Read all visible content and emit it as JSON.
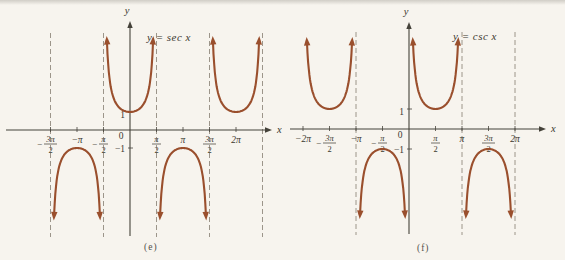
{
  "styles": {
    "background": "#f7f4ee",
    "curve_color": "#9a4f2d",
    "axis_color": "#45423a",
    "asymptote_color": "#918a7e",
    "label_color": "#3b382f",
    "caption_color": "#53504a"
  },
  "chart_data": [
    {
      "type": "line",
      "panel": "e",
      "title": "y = sec x",
      "function": "sec",
      "caption": "(e)",
      "xlabel": "x",
      "ylabel": "y",
      "ylim": [
        -4.8,
        5.0
      ],
      "grid": false,
      "branches": [
        {
          "center_halfpi": 0,
          "direction": "up",
          "extremum_x": "0",
          "extremum_y": 1
        },
        {
          "center_halfpi": -2,
          "direction": "down",
          "extremum_x": "−π",
          "extremum_y": -1
        },
        {
          "center_halfpi": 2,
          "direction": "down",
          "extremum_x": "π",
          "extremum_y": -1
        },
        {
          "center_halfpi": 4,
          "direction": "up",
          "extremum_x": "2π",
          "extremum_y": 1
        }
      ],
      "asymptotes_halfpi": [
        -3,
        -1,
        1,
        3,
        5
      ],
      "x_ticks": [
        {
          "value_halfpi": -3,
          "value": "−3π/2",
          "display": {
            "type": "frac",
            "sign": "−",
            "num": "3π",
            "den": "2"
          }
        },
        {
          "value_halfpi": -2,
          "value": "−π",
          "display": {
            "type": "plain",
            "text": "−π"
          }
        },
        {
          "value_halfpi": -1,
          "value": "−π/2",
          "display": {
            "type": "frac",
            "sign": "−",
            "num": "π",
            "den": "2"
          }
        },
        {
          "value_halfpi": 0,
          "value": "0",
          "display": {
            "type": "plain",
            "text": "0"
          },
          "at_origin": true
        },
        {
          "value_halfpi": 1,
          "value": "π/2",
          "display": {
            "type": "frac",
            "num": "π",
            "den": "2"
          }
        },
        {
          "value_halfpi": 2,
          "value": "π",
          "display": {
            "type": "plain",
            "text": "π"
          }
        },
        {
          "value_halfpi": 3,
          "value": "3π/2",
          "display": {
            "type": "frac",
            "num": "3π",
            "den": "2"
          }
        },
        {
          "value_halfpi": 4,
          "value": "2π",
          "display": {
            "type": "plain",
            "text": "2π"
          }
        }
      ],
      "y_ticks": [
        {
          "value": 1,
          "label": "1"
        },
        {
          "value": -1,
          "label": "−1"
        }
      ],
      "layout": {
        "svg_left": 0,
        "svg_width": 282,
        "origin_px": [
          130,
          130
        ],
        "halfpi_px": 26.5,
        "unit_y_px": 18,
        "x_axis_px": [
          6,
          266
        ],
        "y_axis_px": [
          21,
          236
        ],
        "asymptote_y_px": [
          33,
          237
        ],
        "title_page_px": [
          147,
          31
        ],
        "caption_page_px": [
          144,
          242
        ]
      }
    },
    {
      "type": "line",
      "panel": "f",
      "title": "y = csc x",
      "function": "csc",
      "caption": "(f)",
      "xlabel": "x",
      "ylabel": "y",
      "ylim": [
        -4.3,
        4.4
      ],
      "grid": false,
      "branches": [
        {
          "center_halfpi": -3,
          "direction": "up",
          "extremum_x": "−3π/2",
          "extremum_y": 1
        },
        {
          "center_halfpi": -1,
          "direction": "down",
          "extremum_x": "−π/2",
          "extremum_y": -1
        },
        {
          "center_halfpi": 1,
          "direction": "up",
          "extremum_x": "π/2",
          "extremum_y": 1
        },
        {
          "center_halfpi": 3,
          "direction": "down",
          "extremum_x": "3π/2",
          "extremum_y": -1
        }
      ],
      "asymptotes_halfpi": [
        -2,
        2,
        4
      ],
      "x_ticks": [
        {
          "value_halfpi": -4,
          "value": "−2π",
          "display": {
            "type": "plain",
            "text": "−2π"
          }
        },
        {
          "value_halfpi": -3,
          "value": "−3π/2",
          "display": {
            "type": "frac",
            "sign": "−",
            "num": "3π",
            "den": "2"
          }
        },
        {
          "value_halfpi": -2,
          "value": "−π",
          "display": {
            "type": "plain",
            "text": "−π"
          }
        },
        {
          "value_halfpi": -1,
          "value": "−π/2",
          "display": {
            "type": "frac",
            "sign": "−",
            "num": "π",
            "den": "2"
          }
        },
        {
          "value_halfpi": 0,
          "value": "0",
          "display": {
            "type": "plain",
            "text": "0"
          },
          "at_origin": true
        },
        {
          "value_halfpi": 1,
          "value": "π/2",
          "display": {
            "type": "frac",
            "num": "π",
            "den": "2"
          }
        },
        {
          "value_halfpi": 2,
          "value": "π",
          "display": {
            "type": "plain",
            "text": "π"
          }
        },
        {
          "value_halfpi": 3,
          "value": "3π/2",
          "display": {
            "type": "frac",
            "num": "3π",
            "den": "2"
          }
        },
        {
          "value_halfpi": 4,
          "value": "2π",
          "display": {
            "type": "plain",
            "text": "2π"
          }
        }
      ],
      "y_ticks": [
        {
          "value": 1,
          "label": "1"
        },
        {
          "value": -1,
          "label": "−1"
        }
      ],
      "layout": {
        "svg_left": 282,
        "svg_width": 283,
        "origin_px": [
          127,
          129
        ],
        "halfpi_px": 26.5,
        "unit_y_px": 20,
        "x_axis_px": [
          8,
          258
        ],
        "y_axis_px": [
          22,
          234
        ],
        "asymptote_y_px": [
          32,
          235
        ],
        "title_page_px": [
          453,
          30
        ],
        "caption_page_px": [
          417,
          243
        ]
      }
    }
  ]
}
